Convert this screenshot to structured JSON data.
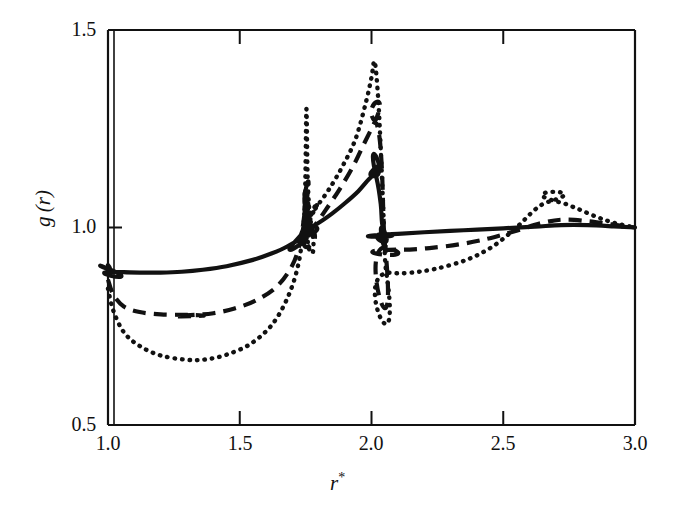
{
  "chart_data": {
    "type": "line",
    "title": "",
    "xlabel": "r*",
    "ylabel": "g (r)",
    "xlim": [
      1.0,
      3.0
    ],
    "ylim": [
      0.5,
      1.5
    ],
    "xticks": [
      1.0,
      1.5,
      2.0,
      2.5,
      3.0
    ],
    "xtick_labels": [
      "1.0",
      "1.5",
      "2.0",
      "2.5",
      "3.0"
    ],
    "yticks": [
      0.5,
      1.0,
      1.5
    ],
    "ytick_labels": [
      "0.5",
      "1.0",
      "1.5"
    ],
    "grid": false,
    "legend": "none",
    "background": "#ffffff",
    "line_color": "#111111",
    "series": [
      {
        "name": "solid",
        "style": "solid",
        "x": [
          1.0,
          1.02,
          1.06,
          1.12,
          1.2,
          1.28,
          1.36,
          1.45,
          1.55,
          1.62,
          1.68,
          1.72,
          1.74,
          1.75,
          1.755,
          1.76,
          1.775,
          1.8,
          1.85,
          1.9,
          1.95,
          1.99,
          2.01,
          2.02,
          2.035,
          2.04,
          2.05,
          2.06,
          2.1,
          2.2,
          2.35,
          2.5,
          2.62,
          2.72,
          2.82,
          2.92,
          3.0
        ],
        "y": [
          0.905,
          0.89,
          0.887,
          0.886,
          0.886,
          0.888,
          0.893,
          0.902,
          0.918,
          0.934,
          0.952,
          0.972,
          0.995,
          1.02,
          1.035,
          1.018,
          1.005,
          1.012,
          1.035,
          1.062,
          1.092,
          1.122,
          1.13,
          1.122,
          1.06,
          1.012,
          0.988,
          0.983,
          0.984,
          0.988,
          0.993,
          0.998,
          1.002,
          1.006,
          1.006,
          1.003,
          1.0
        ]
      },
      {
        "name": "dashed",
        "style": "dashed",
        "x": [
          1.0,
          1.02,
          1.06,
          1.12,
          1.2,
          1.28,
          1.33,
          1.4,
          1.48,
          1.56,
          1.64,
          1.7,
          1.73,
          1.745,
          1.752,
          1.758,
          1.77,
          1.79,
          1.83,
          1.88,
          1.93,
          1.97,
          2.0,
          2.015,
          2.03,
          2.04,
          2.05,
          2.07,
          2.12,
          2.22,
          2.34,
          2.45,
          2.55,
          2.65,
          2.73,
          2.82,
          2.91,
          3.0
        ],
        "y": [
          0.868,
          0.83,
          0.8,
          0.786,
          0.78,
          0.779,
          0.779,
          0.783,
          0.795,
          0.815,
          0.85,
          0.905,
          0.965,
          1.03,
          1.055,
          1.03,
          0.998,
          1.01,
          1.048,
          1.098,
          1.155,
          1.21,
          1.25,
          1.268,
          1.23,
          1.14,
          0.962,
          0.948,
          0.944,
          0.948,
          0.958,
          0.973,
          0.992,
          1.012,
          1.02,
          1.016,
          1.008,
          1.0
        ]
      },
      {
        "name": "dotted",
        "style": "dotted",
        "x": [
          1.0,
          1.02,
          1.06,
          1.12,
          1.2,
          1.3,
          1.37,
          1.45,
          1.54,
          1.62,
          1.68,
          1.72,
          1.74,
          1.748,
          1.753,
          1.758,
          1.768,
          1.78,
          1.8,
          1.84,
          1.89,
          1.94,
          1.98,
          2.0,
          2.012,
          2.025,
          2.035,
          2.045,
          2.055,
          2.08,
          2.14,
          2.24,
          2.36,
          2.46,
          2.55,
          2.62,
          2.67,
          2.72,
          2.78,
          2.85,
          2.92,
          3.0
        ],
        "y": [
          0.845,
          0.79,
          0.735,
          0.7,
          0.676,
          0.665,
          0.666,
          0.678,
          0.705,
          0.752,
          0.82,
          0.9,
          0.99,
          1.09,
          1.3,
          1.12,
          1.02,
          1.04,
          1.06,
          1.098,
          1.155,
          1.225,
          1.32,
          1.38,
          1.42,
          1.33,
          1.2,
          1.04,
          0.892,
          0.885,
          0.885,
          0.895,
          0.918,
          0.952,
          1.0,
          1.045,
          1.065,
          1.063,
          1.048,
          1.028,
          1.012,
          1.0
        ]
      }
    ]
  },
  "axes": {
    "ytick_labels": [
      "1.5",
      "1.0",
      "0.5"
    ],
    "xtick_labels": [
      "1.0",
      "1.5",
      "2.0",
      "2.5",
      "3.0"
    ],
    "ylabel_g": "g",
    "ylabel_r": "(r)",
    "xlabel_r": "r",
    "xlabel_star": "*"
  }
}
